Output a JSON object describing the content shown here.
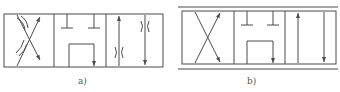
{
  "figure": {
    "diagrams": [
      {
        "id": "a",
        "label": "a)",
        "type": "3-position directional valve symbol with throttles",
        "positions": [
          {
            "name": "left",
            "description": "crossed flow paths with throttles"
          },
          {
            "name": "center",
            "description": "two blocked ports (T) and U-shaped connected passage with arrow"
          },
          {
            "name": "right",
            "description": "parallel flow paths, up and down arrows with throttles"
          }
        ]
      },
      {
        "id": "b",
        "label": "b)",
        "type": "3-position directional valve symbol",
        "positions": [
          {
            "name": "left",
            "description": "crossed flow paths"
          },
          {
            "name": "center",
            "description": "two blocked ports (T) and U-shaped connected passage with arrow"
          },
          {
            "name": "right",
            "description": "parallel flow paths, up and down arrows"
          }
        ]
      }
    ],
    "colors": {
      "line": "#4a4a4a",
      "background": "#ffffff"
    }
  }
}
